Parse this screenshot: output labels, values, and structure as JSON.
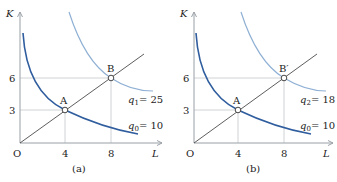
{
  "colors": {
    "axis": "#9aa0a6",
    "guide": "#c4c7cb",
    "ray": "#333333",
    "q0_curve": "#2f5d9e",
    "q_high_curve": "#8fb0d4",
    "point_fill": "#ffffff",
    "point_stroke": "#333333"
  },
  "panels": [
    {
      "id": "a",
      "caption": "(a)",
      "y_axis_label": "K",
      "x_axis_label": "L",
      "origin_label": "O",
      "x_ticks": [
        "4",
        "8"
      ],
      "y_ticks": [
        "3",
        "6"
      ],
      "points": [
        {
          "label": "A",
          "L": 4,
          "K": 3
        },
        {
          "label": "B",
          "L": 8,
          "K": 6
        }
      ],
      "curves": [
        {
          "name": "q1",
          "label_var": "q",
          "label_sub": "1",
          "label_eq": "= 25",
          "value": 25
        },
        {
          "name": "q0",
          "label_var": "q",
          "label_sub": "0",
          "label_eq": "= 10",
          "value": 10
        }
      ]
    },
    {
      "id": "b",
      "caption": "(b)",
      "y_axis_label": "K",
      "x_axis_label": "L",
      "origin_label": "O",
      "x_ticks": [
        "4",
        "8"
      ],
      "y_ticks": [
        "3",
        "6"
      ],
      "points": [
        {
          "label": "A",
          "L": 4,
          "K": 3
        },
        {
          "label": "B′",
          "L": 8,
          "K": 6
        }
      ],
      "curves": [
        {
          "name": "q2",
          "label_var": "q",
          "label_sub": "2",
          "label_eq": "= 18",
          "value": 18
        },
        {
          "name": "q0",
          "label_var": "q",
          "label_sub": "0",
          "label_eq": "= 10",
          "value": 10
        }
      ]
    }
  ]
}
